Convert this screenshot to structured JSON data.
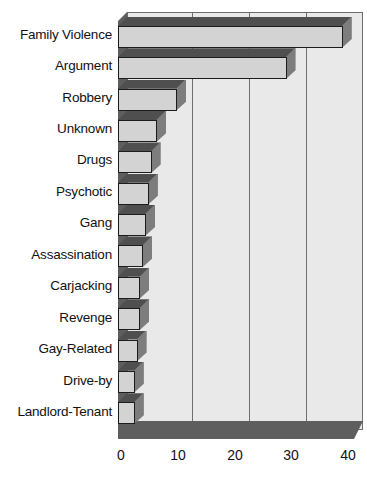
{
  "chart_data": {
    "type": "bar",
    "orientation": "horizontal",
    "style": "3d",
    "title": "",
    "subtitle": "",
    "xlabel": "",
    "ylabel": "",
    "xlim": [
      0,
      45
    ],
    "xticks": [
      0,
      10,
      20,
      30,
      40
    ],
    "xtick_labels": [
      "0",
      "10",
      "20",
      "30",
      "40"
    ],
    "grid": true,
    "grid_axis": "x",
    "legend": false,
    "legend_position": "none",
    "annotations": [],
    "categories": [
      "Family Violence",
      "Argument",
      "Robbery",
      "Unknown",
      "Drugs",
      "Psychotic",
      "Gang",
      "Assassination",
      "Carjacking",
      "Revenge",
      "Gay-Related",
      "Drive-by",
      "Landlord-Tenant"
    ],
    "values": [
      40,
      30,
      10.5,
      7,
      6,
      5.5,
      5,
      4.5,
      4,
      4,
      3.5,
      3,
      3
    ],
    "series": [
      {
        "name": "",
        "values": [
          40,
          30,
          10.5,
          7,
          6,
          5.5,
          5,
          4.5,
          4,
          4,
          3.5,
          3,
          3
        ]
      }
    ]
  },
  "colors": {
    "plot_background": "#e9e9e9",
    "bar_front": "#d3d3d3",
    "bar_side": "#7d7d7d",
    "bar_top": "#4f4f4f",
    "floor": "#5e5e5e",
    "wall": "#5e5e5e",
    "gridline": "#6f6f6f",
    "outline": "#1c1c1c",
    "text": "#111111",
    "page_background": "#ffffff"
  }
}
